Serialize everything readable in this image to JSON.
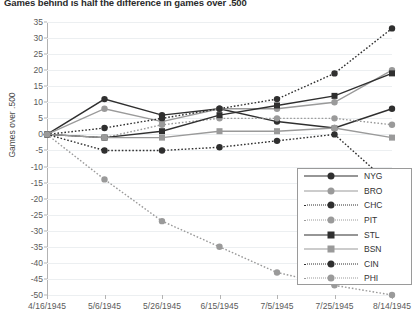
{
  "chart": {
    "title": "Games behind is half the difference in games over .500",
    "ylabel": "Games over .500"
  },
  "chart_data": {
    "type": "line",
    "title": "Games behind is half the difference in games over .500",
    "xlabel": "",
    "ylabel": "Games over .500",
    "ylim": [
      -50,
      35
    ],
    "ytick_step": 5,
    "grid": true,
    "legend_position": "inside-right",
    "categories": [
      "4/16/1945",
      "5/6/1945",
      "5/26/1945",
      "6/15/1945",
      "7/5/1945",
      "7/25/1945",
      "8/14/1945"
    ],
    "yticks": [
      "35",
      "30",
      "25",
      "20",
      "15",
      "10",
      "5",
      "0",
      "-5",
      "-10",
      "-15",
      "-20",
      "-25",
      "-30",
      "-35",
      "-40",
      "-45",
      "-50"
    ],
    "series": [
      {
        "name": "NYG",
        "color": "#2f2f2f",
        "style": "solid",
        "marker": "circle",
        "values": [
          0,
          11,
          6,
          8,
          4,
          2,
          8
        ]
      },
      {
        "name": "BRO",
        "color": "#9a9a9a",
        "style": "solid",
        "marker": "circle",
        "values": [
          0,
          8,
          4,
          8,
          8,
          10,
          20
        ]
      },
      {
        "name": "CHC",
        "color": "#2f2f2f",
        "style": "dotted",
        "marker": "circle",
        "values": [
          0,
          2,
          5,
          8,
          11,
          19,
          33
        ]
      },
      {
        "name": "PIT",
        "color": "#9a9a9a",
        "style": "dotted",
        "marker": "circle",
        "values": [
          0,
          -1,
          3,
          5,
          5,
          5,
          3
        ]
      },
      {
        "name": "STL",
        "color": "#2f2f2f",
        "style": "solid",
        "marker": "square",
        "values": [
          0,
          -1,
          1,
          6,
          9,
          12,
          19
        ]
      },
      {
        "name": "BSN",
        "color": "#9a9a9a",
        "style": "solid",
        "marker": "square",
        "values": [
          0,
          -1,
          -1,
          1,
          1,
          2,
          -1
        ]
      },
      {
        "name": "CIN",
        "color": "#2f2f2f",
        "style": "dotted",
        "marker": "circle",
        "values": [
          0,
          -5,
          -5,
          -4,
          -2,
          0,
          -16
        ]
      },
      {
        "name": "PHI",
        "color": "#9a9a9a",
        "style": "dotted",
        "marker": "circle",
        "values": [
          0,
          -14,
          -27,
          -35,
          -43,
          -47,
          -50
        ]
      }
    ]
  },
  "legend": {
    "items": [
      "NYG",
      "BRO",
      "CHC",
      "PIT",
      "STL",
      "BSN",
      "CIN",
      "PHI"
    ]
  }
}
